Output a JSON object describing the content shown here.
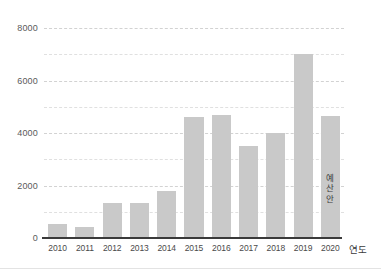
{
  "chart_data": {
    "type": "bar",
    "title": "",
    "subtitle": "",
    "xlabel": "연도",
    "ylabel": "",
    "categories": [
      "2010",
      "2011",
      "2012",
      "2013",
      "2014",
      "2015",
      "2016",
      "2017",
      "2018",
      "2019",
      "2020"
    ],
    "values": [
      540,
      420,
      1350,
      1350,
      1800,
      4600,
      4700,
      3500,
      4000,
      7000,
      4650
    ],
    "annotations": [
      {
        "category": "2020",
        "text": "예산안",
        "orientation": "vertical"
      }
    ],
    "ylim": [
      0,
      8000
    ],
    "ytick_labels": [
      "0",
      "2000",
      "4000",
      "6000",
      "8000"
    ],
    "ytick_values": [
      0,
      2000,
      4000,
      6000,
      8000
    ],
    "minor_gridline_values": [
      1000,
      3000,
      5000,
      7000
    ],
    "grid": true,
    "grid_style": "dashed",
    "legend": "none",
    "bar_color": "#c9c9c9",
    "grid_color": "#d2d2d2",
    "axis_color": "#3a3a3a",
    "text_color": "#4a4a4a"
  }
}
